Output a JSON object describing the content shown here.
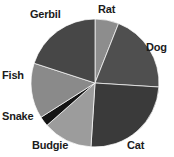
{
  "chart_data": {
    "type": "pie",
    "title": "",
    "xlabel": "",
    "ylabel": "",
    "legend_position": "none",
    "grid": false,
    "labels_position": "outside",
    "start_angle_deg": 0,
    "direction": "clockwise",
    "center": {
      "cx": 95,
      "cy": 83,
      "r": 64
    },
    "categories": [
      "Rat",
      "Dog",
      "Cat",
      "Budgie",
      "Snake",
      "Fish",
      "Gerbil"
    ],
    "values": [
      6,
      20,
      25,
      12.5,
      2.5,
      14,
      20
    ],
    "angles_deg": [
      21.6,
      72,
      90,
      45,
      9,
      50.4,
      72
    ],
    "colors": [
      "#8d8d8d",
      "#4f4f4f",
      "#3a3a3a",
      "#9c9c9c",
      "#141414",
      "#8a8a8a",
      "#474747"
    ],
    "slices": [
      {
        "label": "Rat",
        "value": 6,
        "angle_deg": 21.6,
        "color": "#8d8d8d"
      },
      {
        "label": "Dog",
        "value": 20,
        "angle_deg": 72,
        "color": "#4f4f4f"
      },
      {
        "label": "Cat",
        "value": 25,
        "angle_deg": 90,
        "color": "#3a3a3a"
      },
      {
        "label": "Budgie",
        "value": 12.5,
        "angle_deg": 45,
        "color": "#9c9c9c"
      },
      {
        "label": "Snake",
        "value": 2.5,
        "angle_deg": 9,
        "color": "#141414"
      },
      {
        "label": "Fish",
        "value": 14,
        "angle_deg": 50.4,
        "color": "#8a8a8a"
      },
      {
        "label": "Gerbil",
        "value": 20,
        "angle_deg": 72,
        "color": "#474747"
      }
    ]
  },
  "labels": {
    "rat": "Rat",
    "dog": "Dog",
    "cat": "Cat",
    "budgie": "Budgie",
    "snake": "Snake",
    "fish": "Fish",
    "gerbil": "Gerbil"
  }
}
